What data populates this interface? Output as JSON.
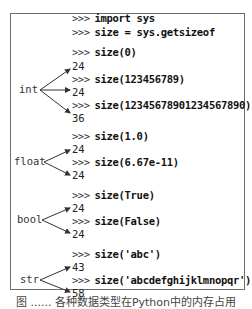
{
  "lines": [
    {
      "type": "input",
      "prompt": ">>>",
      "code": "import sys",
      "y": 19
    },
    {
      "type": "input",
      "prompt": ">>>",
      "code": "size = sys.getsizeof",
      "y": 33
    },
    {
      "type": "input",
      "prompt": ">>>",
      "code": "size(0)",
      "y": 51
    },
    {
      "type": "output",
      "text": "24",
      "y": 64
    },
    {
      "type": "input",
      "prompt": ">>>",
      "code": "size(123456789)",
      "y": 77
    },
    {
      "type": "output",
      "text": "24",
      "y": 90
    },
    {
      "type": "input",
      "prompt": ">>>",
      "code": "size(1234567890123456789 0)",
      "y": 103
    },
    {
      "type": "output",
      "text": "36",
      "y": 116
    },
    {
      "type": "input",
      "prompt": ">>>",
      "code": "size(1.0)",
      "y": 136
    },
    {
      "type": "output",
      "text": "24",
      "y": 149
    },
    {
      "type": "input",
      "prompt": ">>>",
      "code": "size(6.67e-11)",
      "y": 162
    },
    {
      "type": "output",
      "text": "24",
      "y": 175
    },
    {
      "type": "input",
      "prompt": ">>>",
      "code": "size(True)",
      "y": 195
    },
    {
      "type": "output",
      "text": "24",
      "y": 208
    },
    {
      "type": "input",
      "prompt": ">>>",
      "code": "size(False)",
      "y": 221
    },
    {
      "type": "output",
      "text": "24",
      "y": 234
    },
    {
      "type": "input",
      "prompt": ">>>",
      "code": "size('abc')",
      "y": 254
    },
    {
      "type": "output",
      "text": "43",
      "y": 267
    },
    {
      "type": "input",
      "prompt": ">>>",
      "code": "size('abcdefghijklmnopqr')",
      "y": 280
    },
    {
      "type": "output",
      "text": "58",
      "y": 293
    }
  ],
  "labels": {
    "int": "int",
    "float": "float",
    "bool": "bool",
    "str": "str"
  },
  "code": {
    "l0": "import sys",
    "l1": "size = sys.getsizeof",
    "l2": "size(0)",
    "o2": "24",
    "l3": "size(123456789)",
    "o3": "24",
    "l4": "size(12345678901234567890)",
    "o4": "36",
    "l5": "size(1.0)",
    "o5": "24",
    "l6": "size(6.67e-11)",
    "o6": "24",
    "l7": "size(True)",
    "o7": "24",
    "l8": "size(False)",
    "o8": "24",
    "l9": "size('abc')",
    "o9": "43",
    "l10": "size('abcdefghijklmnopqr')",
    "o10": "58",
    "prompt": ">>>"
  },
  "caption": "图 ...... 各种数据类型在Python中的内存占用"
}
